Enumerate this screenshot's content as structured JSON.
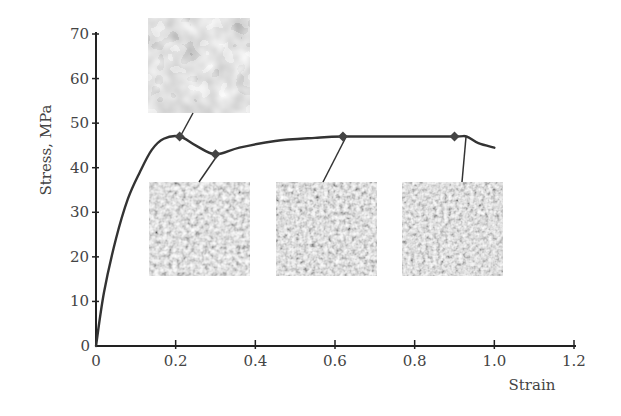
{
  "chart_data": {
    "type": "line",
    "title": "",
    "xlabel": "Strain",
    "ylabel": "Stress, MPa",
    "xlim": [
      0,
      1.2
    ],
    "ylim": [
      0,
      70
    ],
    "grid": false,
    "legend": null,
    "x_ticks": [
      "0",
      "0.2",
      "0.4",
      "0.6",
      "0.8",
      "1.0",
      "1.2"
    ],
    "y_ticks": [
      "0",
      "10",
      "20",
      "30",
      "40",
      "50",
      "60",
      "70"
    ],
    "series": [
      {
        "name": "stress-strain curve",
        "x": [
          0,
          0.02,
          0.05,
          0.08,
          0.11,
          0.14,
          0.17,
          0.21,
          0.25,
          0.3,
          0.36,
          0.45,
          0.55,
          0.62,
          0.75,
          0.9,
          0.93,
          0.96,
          1.0
        ],
        "y": [
          0,
          12,
          24,
          33,
          39,
          44,
          46.5,
          47,
          45,
          43,
          44.5,
          46,
          46.7,
          47,
          47,
          47,
          47,
          45.5,
          44.5
        ]
      }
    ],
    "markers": [
      {
        "x": 0.21,
        "y": 47,
        "label": "microstructure 1 (coarse grains)"
      },
      {
        "x": 0.3,
        "y": 43,
        "label": "microstructure 2"
      },
      {
        "x": 0.62,
        "y": 47,
        "label": "microstructure 3"
      },
      {
        "x": 0.9,
        "y": 47,
        "label": "microstructure 4"
      }
    ],
    "annotations": [
      {
        "type": "image",
        "description": "coarse grain micrograph",
        "attached_marker": 0
      },
      {
        "type": "image",
        "description": "partially recrystallized fine grain micrograph",
        "attached_marker": 1
      },
      {
        "type": "image",
        "description": "fine grain micrograph",
        "attached_marker": 2
      },
      {
        "type": "image",
        "description": "fine grain micrograph",
        "attached_marker": 3
      }
    ]
  },
  "labels": {
    "xlabel": "Strain",
    "ylabel": "Stress, MPa",
    "x_ticks": [
      "0",
      "0.2",
      "0.4",
      "0.6",
      "0.8",
      "1.0",
      "1.2"
    ],
    "y_ticks": [
      "0",
      "10",
      "20",
      "30",
      "40",
      "50",
      "60",
      "70"
    ]
  },
  "colors": {
    "axis": "#222222",
    "curve": "#333333",
    "marker": "#444444"
  }
}
